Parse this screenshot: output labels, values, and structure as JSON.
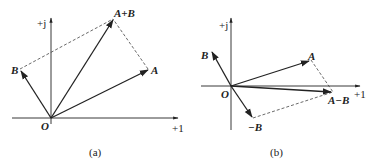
{
  "diagram_a": {
    "caption": "(a)",
    "origin_label": "O",
    "real_axis_label": "+1",
    "imag_axis_label": "+j",
    "vectors": {
      "A": "A",
      "B": "B",
      "sum": "A+B"
    }
  },
  "diagram_b": {
    "caption": "(b)",
    "origin_label": "O",
    "real_axis_label": "+1",
    "imag_axis_label": "+j",
    "vectors": {
      "A": "A",
      "B": "B",
      "neg_B": "−B",
      "diff": "A−B"
    }
  },
  "colors": {
    "line": "#222222",
    "dash": "#444444"
  }
}
